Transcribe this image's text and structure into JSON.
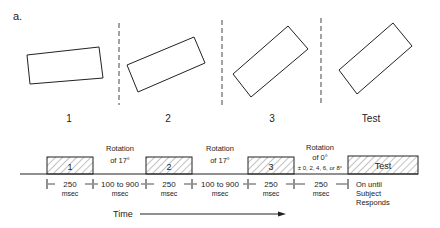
{
  "figure": {
    "panel_label": "a.",
    "frames": [
      {
        "label": "1",
        "rotation_deg": -6
      },
      {
        "label": "2",
        "rotation_deg": -23
      },
      {
        "label": "3",
        "rotation_deg": -40
      },
      {
        "label": "Test",
        "rotation_deg": -40
      }
    ],
    "timeline": {
      "stimuli": [
        {
          "label": "1"
        },
        {
          "label": "2"
        },
        {
          "label": "3"
        },
        {
          "label": "Test"
        }
      ],
      "rotations": [
        {
          "line1": "Rotation",
          "line2": "of 17°"
        },
        {
          "line1": "Rotation",
          "line2": "of 17°"
        },
        {
          "line1": "Rotation",
          "line2": "of 0°",
          "line3": "± 0, 2, 4, 6, or 8°"
        }
      ],
      "durations": [
        {
          "value": "250",
          "unit": "msec"
        },
        {
          "value": "100 to 900",
          "unit": "msec"
        },
        {
          "value": "250",
          "unit": "msec"
        },
        {
          "value": "100 to 900",
          "unit": "msec"
        },
        {
          "value": "250",
          "unit": "msec"
        },
        {
          "value": "250",
          "unit": "msec"
        }
      ],
      "final_note": {
        "line1": "On until",
        "line2": "Subject",
        "line3": "Responds"
      },
      "axis_label": "Time"
    }
  }
}
